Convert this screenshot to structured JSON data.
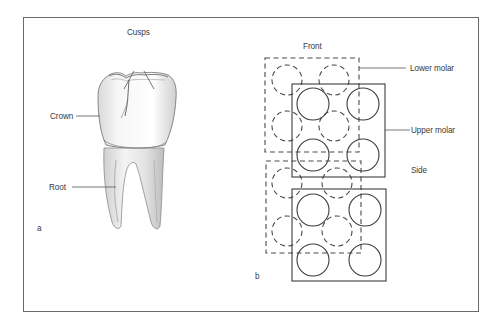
{
  "figure": {
    "panel_a": {
      "label": "a",
      "labels": {
        "cusps": "Cusps",
        "crown": "Crown",
        "root": "Root"
      }
    },
    "panel_b": {
      "label": "b",
      "labels": {
        "front": "Front",
        "lower_molar": "Lower molar",
        "upper_molar": "Upper molar",
        "side": "Side"
      }
    }
  },
  "colors": {
    "line": "#3c3c3c",
    "frame": "#6a6a6a",
    "text": "#3a3a3a"
  }
}
